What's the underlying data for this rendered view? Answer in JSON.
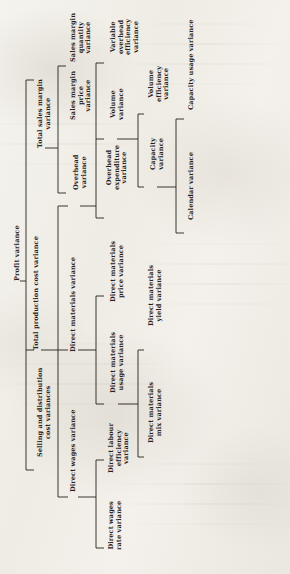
{
  "diagram": {
    "orientation": "rotated-90-counterclockwise",
    "ink_color": "#26211c",
    "paper_color": "#f3f1ec",
    "nodes": [
      {
        "id": "profit",
        "label": "Profit variance",
        "level": 0,
        "x": 14,
        "y": 281
      },
      {
        "id": "selling",
        "label": "Selling and distribution\ncost variances",
        "level": 1,
        "x": 37,
        "y": 457
      },
      {
        "id": "totalprod",
        "label": "Total production cost variance",
        "level": 1,
        "x": 33,
        "y": 350
      },
      {
        "id": "totalsales",
        "label": "Total sales margin\nvariance",
        "level": 1,
        "x": 37,
        "y": 148
      },
      {
        "id": "salesmarginprice",
        "label": "Sales margin\nprice\nvariance",
        "level": 2,
        "x": 70,
        "y": 120
      },
      {
        "id": "salesmarginqty",
        "label": "Sales margin\nquantity\nvariance",
        "level": 2,
        "x": 70,
        "y": 62
      },
      {
        "id": "overhead",
        "label": "Overhead\nvariance",
        "level": 2,
        "x": 73,
        "y": 190
      },
      {
        "id": "directmaterials",
        "label": "Direct materials variance",
        "level": 2,
        "x": 70,
        "y": 352
      },
      {
        "id": "directwages",
        "label": "Direct wages variance",
        "level": 2,
        "x": 70,
        "y": 492
      },
      {
        "id": "overheadexp",
        "label": "Overhead\nexpenditure\nvariance",
        "level": 3,
        "x": 106,
        "y": 190
      },
      {
        "id": "volume",
        "label": "Volume\nvariance",
        "level": 3,
        "x": 110,
        "y": 120
      },
      {
        "id": "varoverheadeff",
        "label": "Variable\noverhead\nefficiency\nvariance",
        "level": 3,
        "x": 110,
        "y": 55
      },
      {
        "id": "dmprice",
        "label": "Direct materials\nprice variance",
        "level": 3,
        "x": 110,
        "y": 302
      },
      {
        "id": "dmusage",
        "label": "Direct materials\nusage variance",
        "level": 3,
        "x": 110,
        "y": 393
      },
      {
        "id": "dlabeff",
        "label": "Direct labour\nefficiency\nvariance",
        "level": 3,
        "x": 108,
        "y": 473
      },
      {
        "id": "dwagesrate",
        "label": "Direct wages\nrate variance",
        "level": 3,
        "x": 108,
        "y": 550
      },
      {
        "id": "capacity",
        "label": "Capacity\nvariance",
        "level": 4,
        "x": 150,
        "y": 170
      },
      {
        "id": "volumeeff",
        "label": "Volume\nefficiency\nvariance",
        "level": 4,
        "x": 148,
        "y": 102
      },
      {
        "id": "dmyield",
        "label": "Direct materials\nyield variance",
        "level": 4,
        "x": 148,
        "y": 326
      },
      {
        "id": "dmmix",
        "label": "Direct materials\nmix variance",
        "level": 4,
        "x": 148,
        "y": 443
      },
      {
        "id": "calendar",
        "label": "Calendar variance",
        "level": 5,
        "x": 188,
        "y": 220
      },
      {
        "id": "capacityusage",
        "label": "Capacity usage variance",
        "level": 5,
        "x": 188,
        "y": 110
      }
    ],
    "edges": [
      {
        "from": "profit",
        "to": "totalsales"
      },
      {
        "from": "profit",
        "to": "totalprod"
      },
      {
        "from": "profit",
        "to": "selling"
      },
      {
        "from": "totalsales",
        "to": "salesmarginqty"
      },
      {
        "from": "totalsales",
        "to": "salesmarginprice"
      },
      {
        "from": "totalprod",
        "to": "overhead"
      },
      {
        "from": "totalprod",
        "to": "directmaterials"
      },
      {
        "from": "totalprod",
        "to": "directwages"
      },
      {
        "from": "overhead",
        "to": "varoverheadeff"
      },
      {
        "from": "overhead",
        "to": "volume"
      },
      {
        "from": "overhead",
        "to": "overheadexp"
      },
      {
        "from": "directmaterials",
        "to": "dmprice"
      },
      {
        "from": "directmaterials",
        "to": "dmusage"
      },
      {
        "from": "directwages",
        "to": "dlabeff"
      },
      {
        "from": "directwages",
        "to": "dwagesrate"
      },
      {
        "from": "volume",
        "to": "volumeeff"
      },
      {
        "from": "volume",
        "to": "capacity"
      },
      {
        "from": "dmusage",
        "to": "dmyield"
      },
      {
        "from": "dmusage",
        "to": "dmmix"
      },
      {
        "from": "capacity",
        "to": "capacityusage"
      },
      {
        "from": "capacity",
        "to": "calendar"
      }
    ],
    "connectors": [
      {
        "name": "profit-stub",
        "x1": 20,
        "y1": 281,
        "x2": 26,
        "y2": 281
      },
      {
        "name": "profit-spine",
        "x1": 26,
        "y1": 80,
        "x2": 26,
        "y2": 470
      },
      {
        "name": "profit-to-totalsales",
        "x1": 26,
        "y1": 80,
        "x2": 34,
        "y2": 80
      },
      {
        "name": "profit-to-totalprod",
        "x1": 26,
        "y1": 350,
        "x2": 34,
        "y2": 350
      },
      {
        "name": "profit-to-selling",
        "x1": 26,
        "y1": 470,
        "x2": 34,
        "y2": 470
      },
      {
        "name": "totalsales-stub",
        "x1": 45,
        "y1": 148,
        "x2": 58,
        "y2": 148
      },
      {
        "name": "totalsales-spine",
        "x1": 58,
        "y1": 66,
        "x2": 58,
        "y2": 193
      },
      {
        "name": "totalsales-to-qty",
        "x1": 58,
        "y1": 66,
        "x2": 66,
        "y2": 66
      },
      {
        "name": "totalsales-to-price",
        "x1": 58,
        "y1": 193,
        "x2": 66,
        "y2": 193
      },
      {
        "name": "totalprod-stub",
        "x1": 41,
        "y1": 350,
        "x2": 58,
        "y2": 350
      },
      {
        "name": "totalprod-spine",
        "x1": 58,
        "y1": 206,
        "x2": 58,
        "y2": 497
      },
      {
        "name": "totalprod-to-overhead",
        "x1": 58,
        "y1": 206,
        "x2": 68,
        "y2": 206
      },
      {
        "name": "totalprod-to-dm",
        "x1": 58,
        "y1": 350,
        "x2": 68,
        "y2": 350
      },
      {
        "name": "totalprod-to-dw",
        "x1": 58,
        "y1": 497,
        "x2": 68,
        "y2": 497
      },
      {
        "name": "overhead-stub",
        "x1": 80,
        "y1": 206,
        "x2": 96,
        "y2": 206
      },
      {
        "name": "overhead-spine",
        "x1": 96,
        "y1": 63,
        "x2": 96,
        "y2": 218
      },
      {
        "name": "overhead-to-varoheff",
        "x1": 96,
        "y1": 63,
        "x2": 104,
        "y2": 63
      },
      {
        "name": "overhead-to-volume",
        "x1": 96,
        "y1": 139,
        "x2": 104,
        "y2": 139
      },
      {
        "name": "overhead-to-ohexp",
        "x1": 96,
        "y1": 218,
        "x2": 104,
        "y2": 218
      },
      {
        "name": "dm-stub",
        "x1": 78,
        "y1": 350,
        "x2": 96,
        "y2": 350
      },
      {
        "name": "dm-spine",
        "x1": 96,
        "y1": 296,
        "x2": 96,
        "y2": 404
      },
      {
        "name": "dm-to-dmprice",
        "x1": 96,
        "y1": 296,
        "x2": 104,
        "y2": 296
      },
      {
        "name": "dm-to-dmusage",
        "x1": 96,
        "y1": 404,
        "x2": 104,
        "y2": 404
      },
      {
        "name": "dw-stub",
        "x1": 78,
        "y1": 497,
        "x2": 96,
        "y2": 497
      },
      {
        "name": "dw-spine",
        "x1": 96,
        "y1": 460,
        "x2": 96,
        "y2": 548
      },
      {
        "name": "dw-to-dlabeff",
        "x1": 96,
        "y1": 460,
        "x2": 104,
        "y2": 460
      },
      {
        "name": "dw-to-dwrate",
        "x1": 96,
        "y1": 548,
        "x2": 104,
        "y2": 548
      },
      {
        "name": "volume-stub",
        "x1": 117,
        "y1": 139,
        "x2": 138,
        "y2": 139
      },
      {
        "name": "volume-spine",
        "x1": 138,
        "y1": 114,
        "x2": 138,
        "y2": 187
      },
      {
        "name": "volume-to-voleff",
        "x1": 138,
        "y1": 114,
        "x2": 144,
        "y2": 114
      },
      {
        "name": "volume-to-capacity",
        "x1": 138,
        "y1": 187,
        "x2": 144,
        "y2": 187
      },
      {
        "name": "dmusage-stub",
        "x1": 118,
        "y1": 404,
        "x2": 138,
        "y2": 404
      },
      {
        "name": "dmusage-spine",
        "x1": 138,
        "y1": 350,
        "x2": 138,
        "y2": 457
      },
      {
        "name": "dmusage-to-yield",
        "x1": 138,
        "y1": 350,
        "x2": 144,
        "y2": 350
      },
      {
        "name": "dmusage-to-mix",
        "x1": 138,
        "y1": 457,
        "x2": 144,
        "y2": 457
      },
      {
        "name": "capacity-stub",
        "x1": 157,
        "y1": 187,
        "x2": 176,
        "y2": 187
      },
      {
        "name": "capacity-spine",
        "x1": 176,
        "y1": 119,
        "x2": 176,
        "y2": 233
      },
      {
        "name": "capacity-to-usage",
        "x1": 176,
        "y1": 119,
        "x2": 184,
        "y2": 119
      },
      {
        "name": "capacity-to-calendar",
        "x1": 176,
        "y1": 233,
        "x2": 184,
        "y2": 233
      }
    ]
  }
}
